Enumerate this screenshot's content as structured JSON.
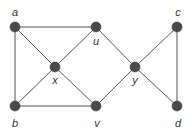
{
  "diagram": {
    "type": "undirected-graph",
    "nodes": [
      {
        "id": "a",
        "label": "a",
        "x": 15,
        "y": 27,
        "lx": 15,
        "ly": 16
      },
      {
        "id": "u",
        "label": "u",
        "x": 96,
        "y": 27,
        "lx": 96,
        "ly": 45
      },
      {
        "id": "c",
        "label": "c",
        "x": 177,
        "y": 27,
        "lx": 178,
        "ly": 16
      },
      {
        "id": "x",
        "label": "x",
        "x": 55,
        "y": 67,
        "lx": 55,
        "ly": 84
      },
      {
        "id": "y",
        "label": "y",
        "x": 135,
        "y": 67,
        "lx": 135,
        "ly": 84
      },
      {
        "id": "b",
        "label": "b",
        "x": 15,
        "y": 106,
        "lx": 15,
        "ly": 127
      },
      {
        "id": "v",
        "label": "v",
        "x": 96,
        "y": 106,
        "lx": 97,
        "ly": 127
      },
      {
        "id": "d",
        "label": "d",
        "x": 177,
        "y": 106,
        "lx": 178,
        "ly": 127
      }
    ],
    "edges": [
      [
        "a",
        "u"
      ],
      [
        "a",
        "b"
      ],
      [
        "a",
        "x"
      ],
      [
        "u",
        "x"
      ],
      [
        "u",
        "y"
      ],
      [
        "x",
        "b"
      ],
      [
        "x",
        "v"
      ],
      [
        "b",
        "v"
      ],
      [
        "v",
        "y"
      ],
      [
        "y",
        "c"
      ],
      [
        "y",
        "d"
      ],
      [
        "c",
        "d"
      ]
    ],
    "colors": {
      "node": "#4a4a4a",
      "edge": "#555555",
      "label": "#333333"
    }
  }
}
